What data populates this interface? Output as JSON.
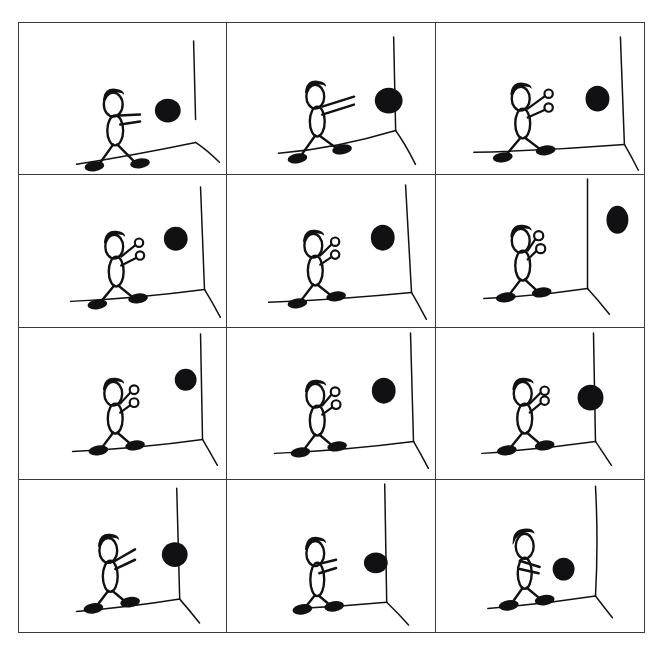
{
  "sheet": {
    "title": "Stick figure ball-bounce storyboard",
    "background_color": "#ffffff",
    "ink_color": "#111113",
    "border_color": "#3a3a3c",
    "columns": 3,
    "rows": 4,
    "panel_count": 12
  },
  "panels": [
    {
      "index": 1,
      "label": "panel-1",
      "caption": "Figure holds ball at chest, facing wall",
      "ball": {
        "cx": 150,
        "cy": 88,
        "rx": 13,
        "ry": 12,
        "state": "held",
        "filled": true
      },
      "hands": "closed",
      "arms": "bent-at-chest",
      "corner_x": 176,
      "floor_y": 140
    },
    {
      "index": 2,
      "label": "panel-2",
      "caption": "Arms extend forward, ball pushed out",
      "ball": {
        "cx": 163,
        "cy": 78,
        "rx": 14,
        "ry": 13,
        "state": "held-extended",
        "filled": true
      },
      "hands": "closed",
      "arms": "extended",
      "corner_x": 168,
      "floor_y": 141
    },
    {
      "index": 3,
      "label": "panel-3",
      "caption": "Ball released, hands open",
      "ball": {
        "cx": 162,
        "cy": 76,
        "rx": 12,
        "ry": 13,
        "state": "released",
        "filled": true
      },
      "hands": "open",
      "arms": "extended",
      "corner_x": 185,
      "floor_y": 148
    },
    {
      "index": 4,
      "label": "panel-4",
      "caption": "Ball in flight toward wall, rising",
      "ball": {
        "cx": 158,
        "cy": 64,
        "rx": 12,
        "ry": 12,
        "state": "in-flight",
        "filled": true
      },
      "hands": "open",
      "arms": "extended",
      "corner_x": 183,
      "floor_y": 143
    },
    {
      "index": 5,
      "label": "panel-5",
      "caption": "Ball nearing the wall",
      "ball": {
        "cx": 157,
        "cy": 63,
        "rx": 12,
        "ry": 13,
        "state": "in-flight",
        "filled": true
      },
      "hands": "open",
      "arms": "extended",
      "corner_x": 180,
      "floor_y": 144
    },
    {
      "index": 6,
      "label": "panel-6",
      "caption": "Ball strikes the wall at the corner",
      "ball": {
        "cx": 182,
        "cy": 45,
        "rx": 11,
        "ry": 14,
        "state": "impact-on-wall",
        "filled": true
      },
      "hands": "open",
      "arms": "extended",
      "corner_x": 186,
      "floor_y": 143
    },
    {
      "index": 7,
      "label": "panel-7",
      "caption": "Ball rebounds off the wall",
      "ball": {
        "cx": 168,
        "cy": 52,
        "rx": 11,
        "ry": 11,
        "state": "rebounding",
        "filled": true
      },
      "hands": "open",
      "arms": "extended",
      "corner_x": 183,
      "floor_y": 144
    },
    {
      "index": 8,
      "label": "panel-8",
      "caption": "Ball travels back toward the figure",
      "ball": {
        "cx": 158,
        "cy": 63,
        "rx": 12,
        "ry": 13,
        "state": "returning",
        "filled": true
      },
      "hands": "open",
      "arms": "extended",
      "corner_x": 185,
      "floor_y": 145
    },
    {
      "index": 9,
      "label": "panel-9",
      "caption": "Ball arrives at the outstretched hands",
      "ball": {
        "cx": 155,
        "cy": 70,
        "rx": 13,
        "ry": 13,
        "state": "arriving",
        "filled": true
      },
      "hands": "open",
      "arms": "extended",
      "corner_x": 182,
      "floor_y": 144
    },
    {
      "index": 10,
      "label": "panel-10",
      "caption": "Figure catches the ball, arms still out",
      "ball": {
        "cx": 157,
        "cy": 72,
        "rx": 13,
        "ry": 12,
        "state": "caught",
        "filled": true
      },
      "hands": "closed",
      "arms": "extended",
      "corner_x": 178,
      "floor_y": 142
    },
    {
      "index": 11,
      "label": "panel-11",
      "caption": "Figure draws the ball back in",
      "ball": {
        "cx": 150,
        "cy": 80,
        "rx": 12,
        "ry": 10,
        "state": "drawing-in",
        "filled": true
      },
      "hands": "closed",
      "arms": "bent",
      "corner_x": 180,
      "floor_y": 142
    },
    {
      "index": 12,
      "label": "panel-12",
      "caption": "Ball back at the chest, ready to throw again",
      "ball": {
        "cx": 128,
        "cy": 86,
        "rx": 11,
        "ry": 11,
        "state": "held",
        "filled": true
      },
      "hands": "closed",
      "arms": "folded-at-chest",
      "corner_x": 182,
      "floor_y": 137
    }
  ]
}
